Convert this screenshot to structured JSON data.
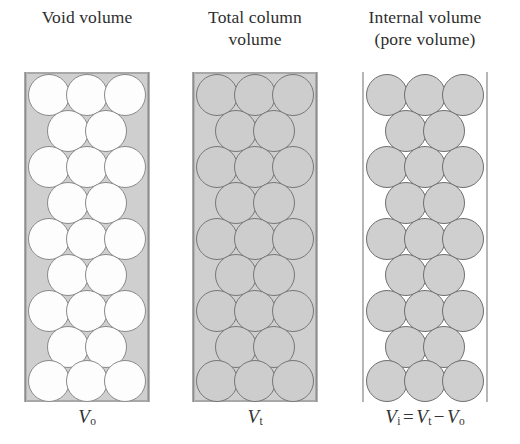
{
  "figure": {
    "title_visible": false,
    "background_color": "#ffffff",
    "bead_gray": "#cfcfcf",
    "bead_outline": "#777777",
    "bead_white": "#fdfdfd",
    "wall_gray": "#9a9a9a"
  },
  "panels": [
    {
      "id": "void-volume",
      "caption_line1": "Void volume",
      "caption_line2": "",
      "formula": {
        "symbol": "V",
        "subscript": "o",
        "full_text": "Vo",
        "expression": ""
      },
      "shading": {
        "beads": "white",
        "background": "gray",
        "meaning": "interstitial space between beads is shaded"
      },
      "packing": {
        "rows": 9,
        "beads_per_full_row": 3,
        "beads_per_offset_row": 2,
        "total_beads": 23
      }
    },
    {
      "id": "total-column-volume",
      "caption_line1": "Total column",
      "caption_line2": "volume",
      "formula": {
        "symbol": "V",
        "subscript": "t",
        "full_text": "Vt",
        "expression": ""
      },
      "shading": {
        "beads": "gray",
        "background": "gray",
        "meaning": "entire column interior is shaded"
      },
      "packing": {
        "rows": 9,
        "beads_per_full_row": 3,
        "beads_per_offset_row": 2,
        "total_beads": 23
      }
    },
    {
      "id": "internal-pore-volume",
      "caption_line1": "Internal volume",
      "caption_line2": "(pore volume)",
      "formula": {
        "symbol": "V",
        "subscript": "i",
        "full_text": "Vi = Vt - Vo",
        "expression": "= Vt − Vo"
      },
      "shading": {
        "beads": "gray",
        "background": "white",
        "meaning": "only the bead interiors are shaded"
      },
      "packing": {
        "rows": 9,
        "beads_per_full_row": 3,
        "beads_per_offset_row": 2,
        "total_beads": 23
      }
    }
  ],
  "formula_tokens": {
    "V": "V",
    "sub_o": "o",
    "sub_t": "t",
    "sub_i": "i",
    "equals": "=",
    "minus": "−"
  }
}
